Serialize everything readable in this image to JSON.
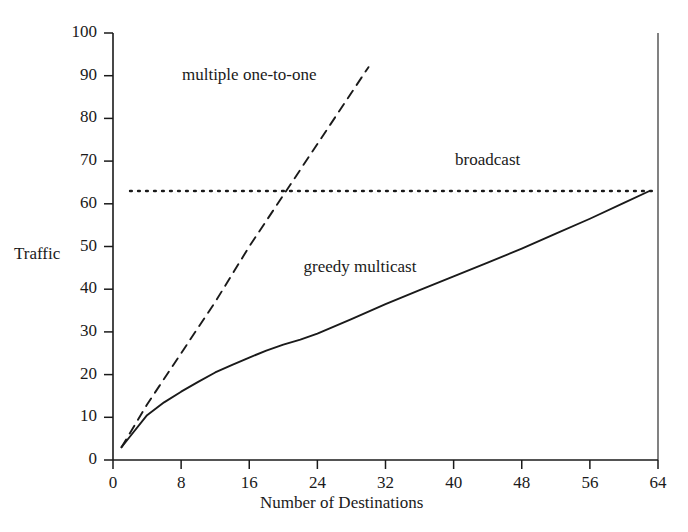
{
  "chart_data": {
    "type": "line",
    "title": "",
    "xlabel": "Number of Destinations",
    "ylabel": "Traffic",
    "xlim": [
      0,
      64
    ],
    "ylim": [
      0,
      100
    ],
    "grid": false,
    "legend_position": "inline-annotations",
    "xticks": [
      0,
      8,
      16,
      24,
      32,
      40,
      48,
      56,
      64
    ],
    "xtick_labels": [
      "0",
      "8",
      "16",
      "24",
      "32",
      "40",
      "48",
      "56",
      "64"
    ],
    "yticks": [
      0,
      10,
      20,
      30,
      40,
      50,
      60,
      70,
      80,
      90,
      100
    ],
    "ytick_labels": [
      "0",
      "10",
      "20",
      "30",
      "40",
      "50",
      "60",
      "70",
      "80",
      "90",
      "100"
    ],
    "series": [
      {
        "name": "multiple one-to-one",
        "style": "dashed",
        "color": "#1a1a1a",
        "label_x": 16,
        "label_y": 90,
        "x": [
          1,
          4,
          8,
          12,
          16,
          20,
          24,
          28,
          30
        ],
        "values": [
          3,
          13,
          25,
          37,
          50,
          62,
          74,
          86,
          92
        ]
      },
      {
        "name": "broadcast",
        "style": "dotted",
        "color": "#1a1a1a",
        "label_x": 44,
        "label_y": 70,
        "x": [
          2,
          64
        ],
        "values": [
          63,
          63
        ]
      },
      {
        "name": "greedy multicast",
        "style": "solid",
        "color": "#1a1a1a",
        "label_x": 29,
        "label_y": 45,
        "x": [
          1,
          2,
          4,
          6,
          8,
          10,
          12,
          14,
          16,
          18,
          20,
          22,
          24,
          28,
          32,
          36,
          40,
          44,
          48,
          52,
          56,
          60,
          63
        ],
        "values": [
          3,
          5.5,
          10.5,
          13.5,
          16,
          18.3,
          20.5,
          22.3,
          24,
          25.6,
          27,
          28.2,
          29.6,
          33,
          36.5,
          39.8,
          43,
          46.2,
          49.5,
          53,
          56.5,
          60.2,
          63
        ]
      }
    ]
  }
}
